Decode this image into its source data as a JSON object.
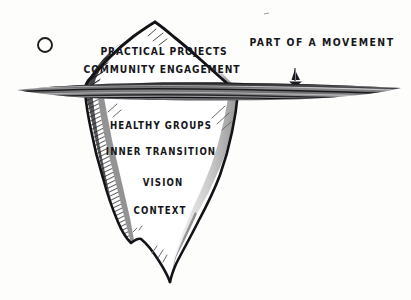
{
  "diagram": {
    "background_color": "#fdfdfc",
    "ink_color": "#16161a",
    "water_color": "#7d7d7d"
  },
  "side_labels": [
    {
      "id": "movement",
      "text": "PART OF A MOVEMENT",
      "x": 322,
      "y": 42
    }
  ],
  "above_water_labels": [
    {
      "id": "practical-projects",
      "text": "PRACTICAL PROJECTS",
      "x": 164,
      "y": 52
    },
    {
      "id": "community-engagement",
      "text": "COMMUNITY ENGAGEMENT",
      "x": 162,
      "y": 70
    }
  ],
  "below_water_labels": [
    {
      "id": "healthy-groups",
      "text": "HEALTHY GROUPS",
      "x": 161,
      "y": 126
    },
    {
      "id": "inner-transition",
      "text": "INNER TRANSITION",
      "x": 161,
      "y": 152
    },
    {
      "id": "vision",
      "text": "VISION",
      "x": 163,
      "y": 183
    },
    {
      "id": "context",
      "text": "CONTEXT",
      "x": 160,
      "y": 211
    }
  ],
  "decorations": [
    {
      "id": "sun-circle",
      "name": "sun-circle-icon",
      "x": 45,
      "y": 45,
      "radius": 7
    },
    {
      "id": "sailboat",
      "name": "sailboat-icon",
      "x": 295,
      "y": 79
    }
  ],
  "waterline": {
    "y_top": 82,
    "y_bottom": 100,
    "x_start": 17,
    "x_end": 401
  }
}
